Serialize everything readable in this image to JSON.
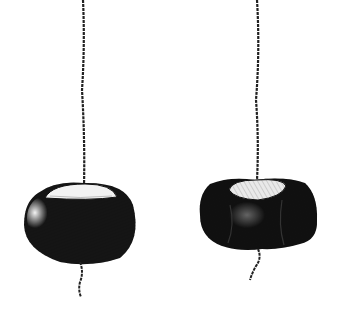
{
  "scene": {
    "description": "Pen-and-ink illustration of two conkers (horse chestnuts) hanging on twisted strings",
    "background": "#ffffff",
    "ink": "#111111",
    "items": [
      {
        "name": "smooth conker",
        "position": "left",
        "string_x": 83
      },
      {
        "name": "battered conker",
        "position": "right",
        "string_x": 257
      }
    ]
  }
}
